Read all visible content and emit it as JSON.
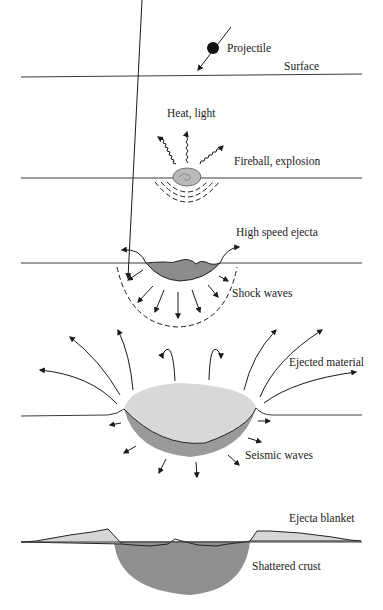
{
  "colors": {
    "background": "#ffffff",
    "ink": "#1a1a1a",
    "surface_line": "#3a3a3a",
    "melt_dark": "#8c8c8c",
    "ejecta_light": "#d6d6d6",
    "crust_shade": "#8f8f8f",
    "fireball": "#b9b9b9"
  },
  "panels": [
    {
      "id": "contact",
      "labels": {
        "projectile": "Projectile",
        "surface": "Surface"
      }
    },
    {
      "id": "compression",
      "labels": {
        "heat": "Heat, light",
        "fireball": "Fireball, explosion"
      }
    },
    {
      "id": "excavation",
      "labels": {
        "ejecta": "High speed ejecta",
        "shock": "Shock waves"
      }
    },
    {
      "id": "crater-growth",
      "labels": {
        "ejected": "Ejected material",
        "seismic": "Seismic waves"
      }
    },
    {
      "id": "final-crater",
      "labels": {
        "blanket": "Ejecta blanket",
        "crust": "Shattered crust"
      }
    }
  ]
}
